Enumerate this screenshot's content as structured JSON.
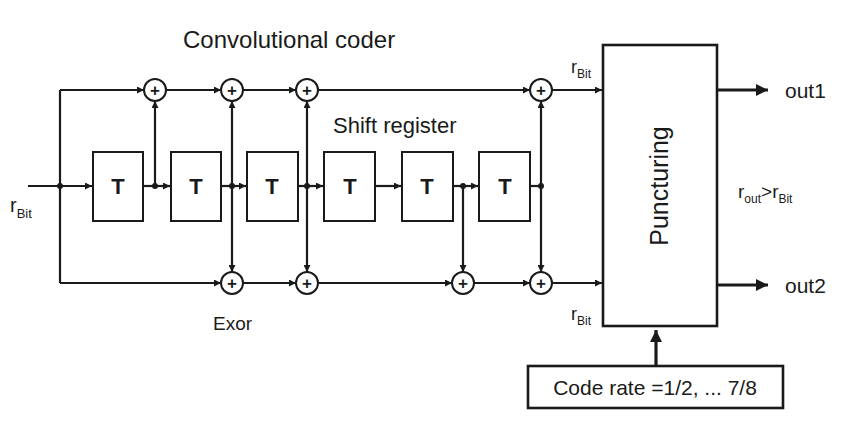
{
  "title": "Convolutional coder",
  "shift_register_label": "Shift register",
  "exor_label": "Exor",
  "input": {
    "rate_label": "r",
    "rate_sub": "Bit"
  },
  "register_cells": [
    {
      "label": "T"
    },
    {
      "label": "T"
    },
    {
      "label": "T"
    },
    {
      "label": "T"
    },
    {
      "label": "T"
    },
    {
      "label": "T"
    }
  ],
  "adder_symbol": "+",
  "puncturing": {
    "label": "Puncturing",
    "in_top": {
      "rate_label": "r",
      "rate_sub": "Bit"
    },
    "in_bottom": {
      "rate_label": "r",
      "rate_sub": "Bit"
    }
  },
  "outputs": [
    {
      "label": "out1"
    },
    {
      "label": "out2"
    }
  ],
  "rate_relation": {
    "left": "r",
    "left_sub": "out",
    "op": ">",
    "right": "r",
    "right_sub": "Bit"
  },
  "code_rate_box": {
    "label": "Code rate =1/2, ... 7/8"
  },
  "colors": {
    "ink": "#1a1a1a",
    "background": "#ffffff"
  }
}
